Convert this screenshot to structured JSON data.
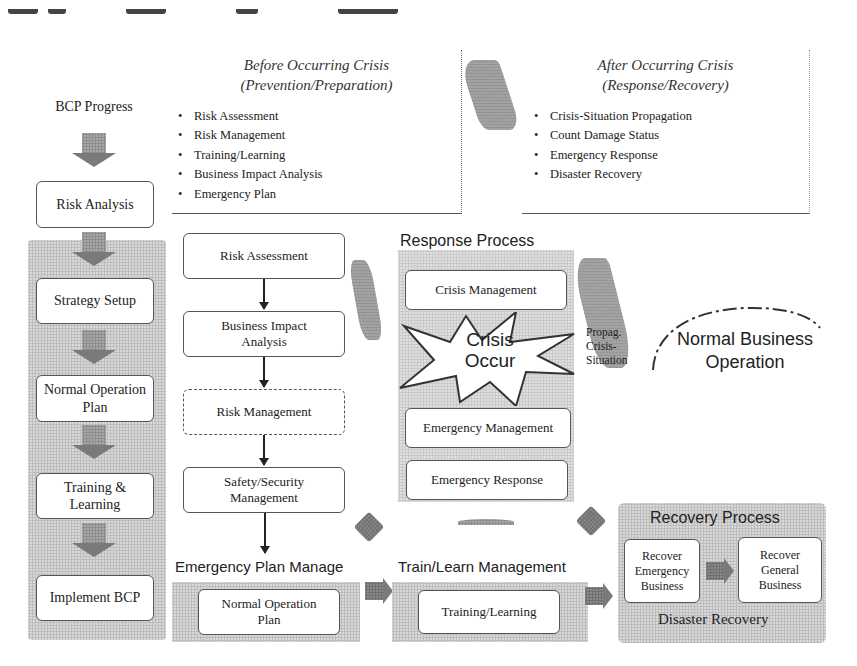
{
  "diagram": {
    "title_cutoff": "",
    "bcp_column": {
      "header": "BCP Progress",
      "steps": [
        "Risk Analysis",
        "Strategy Setup",
        "Normal Operation Plan",
        "Training & Learning",
        "Implement BCP"
      ]
    },
    "before_crisis": {
      "title_line1": "Before Occurring Crisis",
      "title_line2": "(Prevention/Preparation)",
      "items": [
        "Risk Assessment",
        "Risk Management",
        "Training/Learning",
        "Business Impact Analysis",
        "Emergency Plan"
      ]
    },
    "after_crisis": {
      "title_line1": "After Occurring Crisis",
      "title_line2": "(Response/Recovery)",
      "items": [
        "Crisis-Situation Propagation",
        "Count Damage Status",
        "Emergency Response",
        "Disaster Recovery"
      ]
    },
    "prevention_flow": [
      "Risk Assessment",
      "Business Impact Analysis",
      "Risk Management",
      "Safety/Security Management"
    ],
    "response_process": {
      "label": "Response Process",
      "crisis_management": "Crisis Management",
      "crisis_occur_line1": "Crisis",
      "crisis_occur_line2": "Occur",
      "emergency_management": "Emergency Management",
      "emergency_response": "Emergency Response"
    },
    "propagation_label": [
      "Propag.",
      "Crisis-",
      "Situation"
    ],
    "normal_business": [
      "Normal Business",
      "Operation"
    ],
    "emergency_plan_manage": {
      "label": "Emergency Plan Manage",
      "box": "Normal Operation Plan"
    },
    "train_learn_management": {
      "label": "Train/Learn Management",
      "box": "Training/Learning"
    },
    "recovery_process": {
      "label": "Recovery Process",
      "box1": "Recover Emergency Business",
      "box2": "Recover General Business",
      "footer": "Disaster Recovery"
    }
  }
}
